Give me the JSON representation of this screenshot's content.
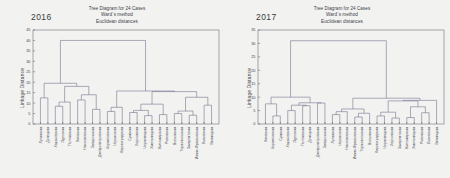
{
  "figure": {
    "background_color": "#f2f2f0",
    "line_color": "#6b6b8a",
    "axis_color": "#5a5a66",
    "text_color": "#40404a"
  },
  "panels": [
    {
      "id": "panel-2016",
      "year": "2016",
      "title_lines": [
        "Tree Diagram for 24 Cases",
        "Ward`s method",
        "Euclidean distances"
      ],
      "ylabel": "Linkage Distance",
      "chart_data": {
        "type": "line",
        "subtype": "dendrogram",
        "title": "Tree Diagram for 24 Cases",
        "subtitle": "Ward`s method / Euclidean distances",
        "xlabel": "",
        "ylabel": "Linkage Distance",
        "ylim": [
          0,
          45
        ],
        "yticks": [
          0,
          5,
          10,
          15,
          20,
          25,
          30,
          35,
          40,
          45
        ],
        "grid": false,
        "legend": "none",
        "n_cases": 24,
        "linkage_method": "Ward",
        "distance_metric": "Euclidean",
        "leaves": [
          "Луганская",
          "Донецкая",
          "Харьковская",
          "Одесская",
          "Полтавская",
          "Киевская",
          "Николаевская",
          "Запорожская",
          "Днепропетровская",
          "Черниговская",
          "Черкасская",
          "Кировоградская",
          "Сумская",
          "Херсонская",
          "Черновицкая",
          "Хмельницкая",
          "Житомирская",
          "Ровенская",
          "Волынская",
          "Тернопольская",
          "Закарпатская",
          "Ивано-Франковская",
          "Львовская",
          "Винницкая"
        ],
        "merges": [
          {
            "height": 12.5,
            "label": "m1"
          },
          {
            "height": 8.5,
            "label": "m2"
          },
          {
            "height": 10.5,
            "label": "m3"
          },
          {
            "height": 11.5,
            "label": "m4"
          },
          {
            "height": 7.0,
            "label": "m5"
          },
          {
            "height": 14.0,
            "label": "m6"
          },
          {
            "height": 18.0,
            "label": "m7"
          },
          {
            "height": 19.5,
            "label": "m8"
          },
          {
            "height": 6.0,
            "label": "m9"
          },
          {
            "height": 8.0,
            "label": "m10"
          },
          {
            "height": 5.5,
            "label": "m11"
          },
          {
            "height": 4.0,
            "label": "m12"
          },
          {
            "height": 4.5,
            "label": "m13"
          },
          {
            "height": 6.5,
            "label": "m14"
          },
          {
            "height": 9.5,
            "label": "m15"
          },
          {
            "height": 5.0,
            "label": "m16"
          },
          {
            "height": 4.2,
            "label": "m17"
          },
          {
            "height": 6.2,
            "label": "m18"
          },
          {
            "height": 9.0,
            "label": "m19"
          },
          {
            "height": 12.8,
            "label": "m20"
          },
          {
            "height": 15.5,
            "label": "m21"
          },
          {
            "height": 40.0,
            "label": "root"
          }
        ],
        "root_height": 40.0
      }
    },
    {
      "id": "panel-2017",
      "year": "2017",
      "title_lines": [
        "Tree Diagram for 24 Cases",
        "Ward`s method",
        "Euclidean distances"
      ],
      "ylabel": "Linkage Distance",
      "chart_data": {
        "type": "line",
        "subtype": "dendrogram",
        "title": "Tree Diagram for 24 Cases",
        "subtitle": "Ward`s method / Euclidean distances",
        "xlabel": "",
        "ylabel": "Linkage Distance",
        "ylim": [
          0,
          35
        ],
        "yticks": [
          0,
          5,
          10,
          15,
          20,
          25,
          30,
          35
        ],
        "grid": false,
        "legend": "none",
        "n_cases": 24,
        "linkage_method": "Ward",
        "distance_metric": "Euclidean",
        "leaves": [
          "Киевская",
          "Черниговская",
          "Сумская",
          "Харьковская",
          "Одесская",
          "Полтавская",
          "Донецкая",
          "Днепропетровская",
          "Запорожская",
          "Луганская",
          "Черкасская",
          "Николаевская",
          "Ивано-Франковская",
          "Тернопольская",
          "Волынская",
          "Кировоградская",
          "Черновицкая",
          "Херсонская",
          "Закарпатская",
          "Житомирская",
          "Хмельницкая",
          "Ровенская",
          "Львовская",
          "Винницкая"
        ],
        "merges": [
          {
            "height": 7.5,
            "label": "m1"
          },
          {
            "height": 3.0,
            "label": "m2"
          },
          {
            "height": 5.0,
            "label": "m3"
          },
          {
            "height": 6.8,
            "label": "m4"
          },
          {
            "height": 7.8,
            "label": "m5"
          },
          {
            "height": 7.6,
            "label": "m6"
          },
          {
            "height": 10.0,
            "label": "m7"
          },
          {
            "height": 3.5,
            "label": "m8"
          },
          {
            "height": 4.6,
            "label": "m9"
          },
          {
            "height": 2.6,
            "label": "m10"
          },
          {
            "height": 4.0,
            "label": "m11"
          },
          {
            "height": 5.6,
            "label": "m12"
          },
          {
            "height": 9.6,
            "label": "m13"
          },
          {
            "height": 3.0,
            "label": "m14"
          },
          {
            "height": 2.2,
            "label": "m15"
          },
          {
            "height": 1.6,
            "label": "m16"
          },
          {
            "height": 4.4,
            "label": "m17"
          },
          {
            "height": 2.4,
            "label": "m18"
          },
          {
            "height": 4.2,
            "label": "m19"
          },
          {
            "height": 6.4,
            "label": "m20"
          },
          {
            "height": 8.6,
            "label": "m21"
          },
          {
            "height": 31.0,
            "label": "root"
          }
        ],
        "root_height": 31.0
      }
    }
  ]
}
